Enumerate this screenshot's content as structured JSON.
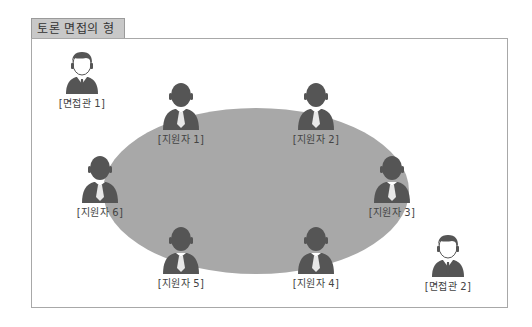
{
  "title": "토론 면접의 형태",
  "colors": {
    "table": "#a8a8a8",
    "person": "#555555",
    "title_bg": "#c8c8c8",
    "border": "#a8a8a8"
  },
  "interviewers": [
    {
      "label": "[면접관 1]",
      "icon": "interviewer-icon"
    },
    {
      "label": "[면접관 2]",
      "icon": "interviewer-icon"
    }
  ],
  "candidates": [
    {
      "label": "[지원자 1]",
      "icon": "candidate-icon"
    },
    {
      "label": "[지원자 2]",
      "icon": "candidate-icon"
    },
    {
      "label": "[지원자 3]",
      "icon": "candidate-icon"
    },
    {
      "label": "[지원자 4]",
      "icon": "candidate-icon"
    },
    {
      "label": "[지원자 5]",
      "icon": "candidate-icon"
    },
    {
      "label": "[지원자 6]",
      "icon": "candidate-icon"
    }
  ],
  "table": {
    "shape": "ellipse"
  }
}
